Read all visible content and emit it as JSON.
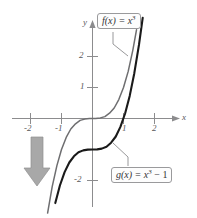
{
  "chart_data": {
    "type": "line",
    "title": "",
    "xlabel": "x",
    "ylabel": "y",
    "xlim": [
      -2.55,
      2.45
    ],
    "ylim": [
      -2.75,
      2.75
    ],
    "grid": false,
    "legend": "callout-labels",
    "x_ticks": [
      -2,
      -1,
      1,
      2
    ],
    "x_tick_labels": [
      "-2",
      "-1",
      "1",
      "2"
    ],
    "y_ticks": [
      2,
      1,
      -1,
      -2
    ],
    "y_tick_labels": [
      "2",
      "1",
      "",
      "-2"
    ],
    "series": [
      {
        "name": "f",
        "label": "f(x) = x^3",
        "formula": "x^3",
        "color": "#6e6e70",
        "width": 1.5,
        "x": [
          -1.45,
          -1.3,
          -1.15,
          -1.0,
          -0.85,
          -0.7,
          -0.55,
          -0.4,
          -0.25,
          -0.1,
          0.0,
          0.1,
          0.25,
          0.4,
          0.55,
          0.7,
          0.85,
          1.0,
          1.15,
          1.3,
          1.42
        ],
        "y": [
          -3.05,
          -2.2,
          -1.52,
          -1.0,
          -0.61,
          -0.34,
          -0.17,
          -0.06,
          -0.02,
          -0.001,
          0.0,
          0.001,
          0.02,
          0.06,
          0.17,
          0.34,
          0.61,
          1.0,
          1.52,
          2.2,
          2.86
        ]
      },
      {
        "name": "g",
        "label": "g(x) = x^3 - 1",
        "formula": "x^3 - 1",
        "color": "#1a1a1a",
        "width": 2.1,
        "x": [
          -1.2,
          -1.05,
          -0.9,
          -0.75,
          -0.6,
          -0.45,
          -0.3,
          -0.15,
          0.0,
          0.15,
          0.3,
          0.45,
          0.6,
          0.75,
          0.9,
          1.05,
          1.2,
          1.35,
          1.5,
          1.62
        ],
        "y": [
          -2.73,
          -2.16,
          -1.73,
          -1.42,
          -1.22,
          -1.09,
          -1.03,
          -1.003,
          -1.0,
          -0.997,
          -0.97,
          -0.91,
          -0.78,
          -0.58,
          -0.27,
          0.16,
          0.73,
          1.46,
          2.38,
          3.25
        ]
      }
    ],
    "annotations": [
      {
        "name": "f-callout",
        "text": "f(x) = x3",
        "base": "f(x) = x",
        "exponent": "3",
        "points_to": "f-curve"
      },
      {
        "name": "g-callout",
        "text": "g(x) = x3 - 1",
        "base": "g(x) = x",
        "exponent": "3",
        "tail": "- 1",
        "points_to": "g-curve"
      },
      {
        "name": "shift-arrow",
        "direction": "down",
        "meaning": "vertical shift down 1 unit",
        "color": "#a6a6a6"
      }
    ]
  },
  "axes": {
    "x_axis_label": "x",
    "y_axis_label": "y",
    "axis_color": "#8c8c8e",
    "x_labels": [
      {
        "text": "-2",
        "value": -2
      },
      {
        "text": "-1",
        "value": -1
      },
      {
        "text": "1",
        "value": 1
      },
      {
        "text": "2",
        "value": 2
      }
    ],
    "y_labels": [
      {
        "text": "2",
        "value": 2
      },
      {
        "text": "1",
        "value": 1
      },
      {
        "text": "-2",
        "value": -2
      }
    ]
  },
  "callouts": {
    "f": {
      "base": "f(x) = x",
      "exp": "3",
      "tail": ""
    },
    "g": {
      "base": "g(x) = x",
      "exp": "3",
      "tail": " − 1"
    }
  }
}
